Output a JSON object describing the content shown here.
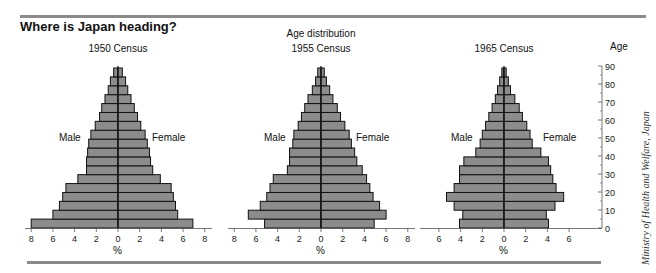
{
  "header": {
    "title": "Where is Japan heading?",
    "subtitle": "Age distribution"
  },
  "labels": {
    "male": "Male",
    "female": "Female",
    "percent": "%",
    "age_axis_title": "Age"
  },
  "credit": "Ministry of Health and Welfare, Japan",
  "colors": {
    "bar_fill": "#8c8c8c",
    "bar_stroke": "#111111",
    "rule": "#8a8a8a"
  },
  "chart_data": [
    {
      "type": "bar",
      "subtype": "population-pyramid",
      "title": "1950 Census",
      "xlabel": "%",
      "ylabel": "Age",
      "categories": [
        "0-4",
        "5-9",
        "10-14",
        "15-19",
        "20-24",
        "25-29",
        "30-34",
        "35-39",
        "40-44",
        "45-49",
        "50-54",
        "55-59",
        "60-64",
        "65-69",
        "70-74",
        "75-79",
        "80-84",
        "85+"
      ],
      "x_ticks": [
        8,
        6,
        4,
        2,
        0,
        2,
        4,
        6,
        8
      ],
      "xlim": [
        -8,
        8
      ],
      "series": [
        {
          "name": "Male",
          "values": [
            8.0,
            6.0,
            5.4,
            5.1,
            4.8,
            3.7,
            2.9,
            2.9,
            2.8,
            2.7,
            2.5,
            2.1,
            1.7,
            1.5,
            1.2,
            0.9,
            0.7,
            0.4
          ]
        },
        {
          "name": "Female",
          "values": [
            6.9,
            5.5,
            5.3,
            5.1,
            4.9,
            3.9,
            3.2,
            3.0,
            2.9,
            2.7,
            2.5,
            2.1,
            1.8,
            1.5,
            1.2,
            0.9,
            0.7,
            0.4
          ]
        }
      ]
    },
    {
      "type": "bar",
      "subtype": "population-pyramid",
      "title": "1955 Census",
      "xlabel": "%",
      "ylabel": "Age",
      "categories": [
        "0-4",
        "5-9",
        "10-14",
        "15-19",
        "20-24",
        "25-29",
        "30-34",
        "35-39",
        "40-44",
        "45-49",
        "50-54",
        "55-59",
        "60-64",
        "65-69",
        "70-74",
        "75-79",
        "80-84",
        "85+"
      ],
      "x_ticks": [
        8,
        6,
        4,
        2,
        0,
        2,
        4,
        6,
        8
      ],
      "xlim": [
        -8,
        8
      ],
      "series": [
        {
          "name": "Male",
          "values": [
            5.2,
            6.7,
            5.6,
            5.0,
            4.7,
            4.4,
            3.1,
            2.9,
            2.9,
            2.6,
            2.5,
            2.1,
            1.8,
            1.5,
            1.2,
            0.8,
            0.5,
            0.3
          ]
        },
        {
          "name": "Female",
          "values": [
            4.9,
            6.0,
            5.4,
            4.8,
            4.5,
            4.2,
            3.8,
            3.3,
            3.1,
            2.8,
            2.6,
            2.2,
            1.8,
            1.5,
            1.1,
            0.8,
            0.5,
            0.3
          ]
        }
      ]
    },
    {
      "type": "bar",
      "subtype": "population-pyramid",
      "title": "1965 Census",
      "xlabel": "%",
      "ylabel": "Age",
      "categories": [
        "0-4",
        "5-9",
        "10-14",
        "15-19",
        "20-24",
        "25-29",
        "30-34",
        "35-39",
        "40-44",
        "45-49",
        "50-54",
        "55-59",
        "60-64",
        "65-69",
        "70-74",
        "75-79",
        "80-84",
        "85+"
      ],
      "x_ticks": [
        6,
        4,
        2,
        0,
        2,
        4,
        6
      ],
      "xlim": [
        -6,
        6
      ],
      "series": [
        {
          "name": "Male",
          "values": [
            4.1,
            3.8,
            4.6,
            5.3,
            4.6,
            4.1,
            4.1,
            3.7,
            2.6,
            2.2,
            2.0,
            1.7,
            1.4,
            1.1,
            0.8,
            0.6,
            0.4,
            0.2
          ]
        },
        {
          "name": "Female",
          "values": [
            4.1,
            3.9,
            4.7,
            5.5,
            4.8,
            4.5,
            4.3,
            4.1,
            3.4,
            2.6,
            2.4,
            2.1,
            1.7,
            1.4,
            1.0,
            0.6,
            0.4,
            0.2
          ]
        }
      ]
    }
  ],
  "age_axis": {
    "ticks": [
      0,
      10,
      20,
      30,
      40,
      50,
      60,
      70,
      80,
      90
    ],
    "range": [
      0,
      90
    ]
  }
}
